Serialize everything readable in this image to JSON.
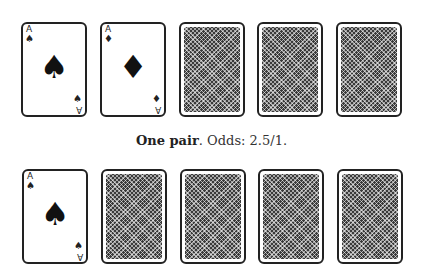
{
  "hands": [
    {
      "cards": [
        {
          "face": "up",
          "rank": "A",
          "suit": "♠",
          "suit_name": "spades"
        },
        {
          "face": "up",
          "rank": "A",
          "suit": "♦",
          "suit_name": "diamonds"
        },
        {
          "face": "down"
        },
        {
          "face": "down"
        },
        {
          "face": "down"
        }
      ]
    },
    {
      "cards": [
        {
          "face": "up",
          "rank": "A",
          "suit": "♠",
          "suit_name": "spades"
        },
        {
          "face": "down"
        },
        {
          "face": "down"
        },
        {
          "face": "down"
        },
        {
          "face": "down"
        }
      ]
    }
  ],
  "caption": {
    "hand_name": "One pair",
    "odds_text": ". Odds: 2.5/1."
  }
}
